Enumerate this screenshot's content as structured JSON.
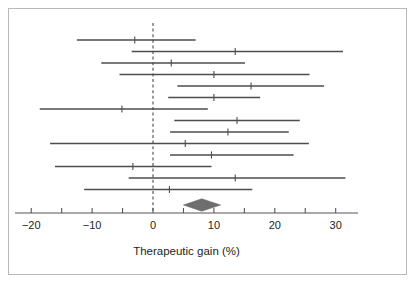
{
  "figure": {
    "kind": "forest-plot",
    "frame_border_color": "#b9b9b9",
    "background": "#ffffff"
  },
  "chart_data": {
    "type": "forest",
    "title": "",
    "subtitle": "",
    "xlabel": "Therapeutic gain (%)",
    "ylabel": "",
    "xlim": [
      -22.5,
      33.5
    ],
    "xticks": [
      -20,
      -15,
      -10,
      -5,
      0,
      5,
      10,
      15,
      20,
      25,
      30
    ],
    "xtick_labels_major": [
      "-20",
      "-10",
      "0",
      "10",
      "20",
      "30"
    ],
    "xtick_label_values": [
      -20,
      -10,
      0,
      10,
      20,
      30
    ],
    "grid": false,
    "legend": null,
    "reference_line": {
      "value": 0,
      "style": "dashed",
      "color": "#4a4a4a"
    },
    "marker_style": "vertical-tick",
    "line_color": "#4d4d4d",
    "series_name": "Studies",
    "studies": [
      {
        "index": 1,
        "estimate": -3.0,
        "ci_low": -12.5,
        "ci_high": 7.0
      },
      {
        "index": 2,
        "estimate": 13.5,
        "ci_low": -3.5,
        "ci_high": 31.2
      },
      {
        "index": 3,
        "estimate": 3.0,
        "ci_low": -8.5,
        "ci_high": 15.1
      },
      {
        "index": 4,
        "estimate": 10.0,
        "ci_low": -5.5,
        "ci_high": 25.7
      },
      {
        "index": 5,
        "estimate": 16.1,
        "ci_low": 4.0,
        "ci_high": 28.1
      },
      {
        "index": 6,
        "estimate": 10.0,
        "ci_low": 2.5,
        "ci_high": 17.6
      },
      {
        "index": 7,
        "estimate": -5.1,
        "ci_low": -18.6,
        "ci_high": 9.0
      },
      {
        "index": 8,
        "estimate": 13.8,
        "ci_low": 3.5,
        "ci_high": 24.1
      },
      {
        "index": 9,
        "estimate": 12.3,
        "ci_low": 2.8,
        "ci_high": 22.3
      },
      {
        "index": 10,
        "estimate": 5.3,
        "ci_low": -16.9,
        "ci_high": 25.6
      },
      {
        "index": 11,
        "estimate": 9.6,
        "ci_low": 2.8,
        "ci_high": 23.1
      },
      {
        "index": 12,
        "estimate": -3.3,
        "ci_low": -16.1,
        "ci_high": 9.6
      },
      {
        "index": 13,
        "estimate": 13.5,
        "ci_low": -4.0,
        "ci_high": 31.6
      },
      {
        "index": 14,
        "estimate": 2.7,
        "ci_low": -11.3,
        "ci_high": 16.3
      }
    ],
    "summary": {
      "label": "Overall",
      "estimate": 8.0,
      "ci_low": 5.0,
      "ci_high": 11.1,
      "shape": "diamond",
      "color": "#6e6e6e"
    }
  }
}
